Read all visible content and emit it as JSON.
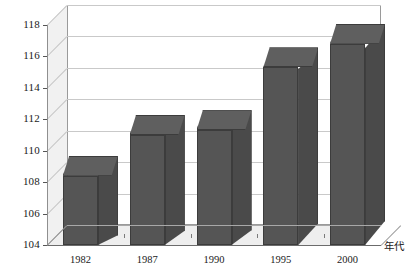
{
  "chart_data": {
    "type": "bar",
    "title": "",
    "xlabel": "年代",
    "ylabel": "",
    "categories": [
      "1982",
      "1987",
      "1990",
      "1995",
      "2000"
    ],
    "values": [
      108.4,
      111.0,
      111.3,
      115.3,
      116.8
    ],
    "series": [
      {
        "name": "",
        "values": [
          108.4,
          111.0,
          111.3,
          115.3,
          116.8
        ]
      }
    ],
    "ylim": [
      104,
      118
    ],
    "yticks": [
      104,
      106,
      108,
      110,
      112,
      114,
      116,
      118
    ],
    "ytick_labels": [
      "104",
      "106",
      "108",
      "110",
      "112",
      "114",
      "116",
      "118"
    ],
    "grid": true,
    "grid_axis": "y",
    "legend": false,
    "legend_position": "none",
    "three_d": true,
    "bar_color": "#555555",
    "bar_top_color": "#5f5f5f",
    "bar_side_color": "#4a4a4a",
    "wall_color": "#f1f1f1",
    "floor_color": "#eeeeee",
    "gridline_color": "#c9c9c9",
    "axis_color": "#555555",
    "annotations": []
  },
  "axis": {
    "x_title": "年代"
  }
}
